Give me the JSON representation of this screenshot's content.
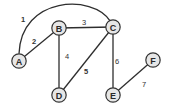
{
  "diagram": {
    "type": "weighted-undirected-graph",
    "colors": {
      "background": "#ffffff",
      "edge": "#2e2e2e",
      "node_fill": "#e6e6e6",
      "node_stroke": "#333333",
      "text": "#2a2a2a"
    },
    "nodes": [
      {
        "id": "A",
        "label": "A",
        "x": 19,
        "y": 61
      },
      {
        "id": "B",
        "label": "B",
        "x": 59,
        "y": 28
      },
      {
        "id": "C",
        "label": "C",
        "x": 113,
        "y": 27
      },
      {
        "id": "D",
        "label": "D",
        "x": 59,
        "y": 95
      },
      {
        "id": "E",
        "label": "E",
        "x": 113,
        "y": 95
      },
      {
        "id": "F",
        "label": "F",
        "x": 153,
        "y": 60
      }
    ],
    "edges": [
      {
        "from": "A",
        "to": "C",
        "label": "1",
        "curved": true,
        "label_x": 23,
        "label_y": 19
      },
      {
        "from": "A",
        "to": "B",
        "label": "2",
        "curved": false,
        "label_x": 34,
        "label_y": 41
      },
      {
        "from": "B",
        "to": "C",
        "label": "3",
        "curved": false,
        "label_x": 84,
        "label_y": 22
      },
      {
        "from": "B",
        "to": "D",
        "label": "4",
        "curved": false,
        "label_x": 67,
        "label_y": 56
      },
      {
        "from": "C",
        "to": "D",
        "label": "5",
        "curved": false,
        "label_x": 86,
        "label_y": 71
      },
      {
        "from": "C",
        "to": "E",
        "label": "6",
        "curved": false,
        "label_x": 117,
        "label_y": 61
      },
      {
        "from": "E",
        "to": "F",
        "label": "7",
        "curved": false,
        "label_x": 144,
        "label_y": 84
      }
    ]
  }
}
